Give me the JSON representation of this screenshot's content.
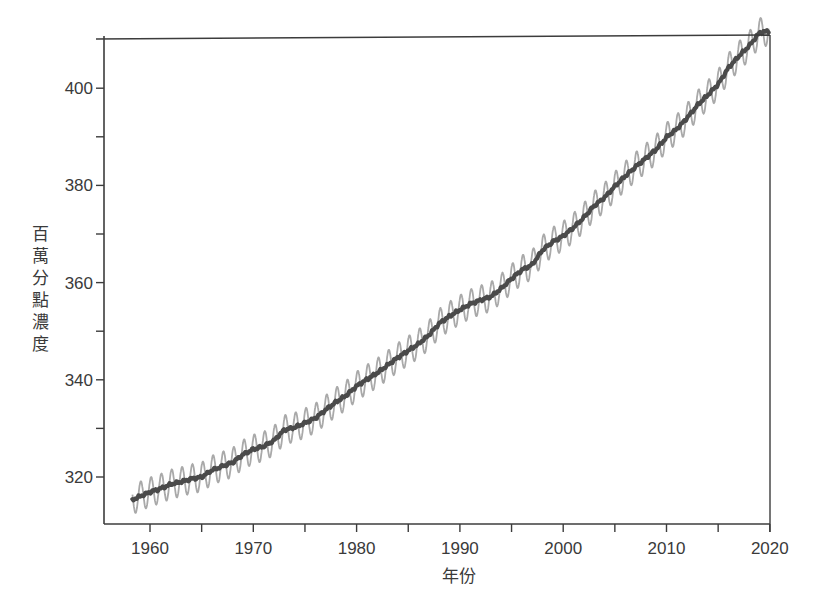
{
  "chart_data": {
    "type": "line",
    "title": "",
    "xlabel": "年份",
    "ylabel": "百萬分點濃度",
    "xlim": [
      1955.5,
      2020
    ],
    "ylim": [
      311,
      411
    ],
    "grid": false,
    "legend": null,
    "x_ticks": {
      "major": [
        1960,
        1970,
        1980,
        1990,
        2000,
        2010,
        2020
      ],
      "major_labels": [
        "1960",
        "1970",
        "1980",
        "1990",
        "2000",
        "2010",
        "2020"
      ],
      "minor": [
        1965,
        1975,
        1985,
        1995,
        2005,
        2015
      ]
    },
    "y_ticks": {
      "major": [
        320,
        340,
        360,
        380,
        400
      ],
      "major_labels": [
        "320",
        "340",
        "360",
        "380",
        "400"
      ],
      "minor": [
        330,
        350,
        370,
        390
      ]
    },
    "series": [
      {
        "name": "annual_trend",
        "style": "thick dark line",
        "color": "#4a4a4a",
        "x": [
          1958.3,
          1959,
          1960,
          1961,
          1962,
          1963,
          1964,
          1965,
          1966,
          1967,
          1968,
          1969,
          1970,
          1971,
          1972,
          1973,
          1974,
          1975,
          1976,
          1977,
          1978,
          1979,
          1980,
          1981,
          1982,
          1983,
          1984,
          1985,
          1986,
          1987,
          1988,
          1989,
          1990,
          1991,
          1992,
          1993,
          1994,
          1995,
          1996,
          1997,
          1998,
          1999,
          2000,
          2001,
          2002,
          2003,
          2004,
          2005,
          2006,
          2007,
          2008,
          2009,
          2010,
          2011,
          2012,
          2013,
          2014,
          2015,
          2016,
          2017,
          2018,
          2019,
          2019.9
        ],
        "values": [
          315.3,
          316.0,
          316.9,
          317.6,
          318.5,
          319.0,
          319.6,
          320.0,
          321.4,
          322.2,
          323.0,
          324.6,
          325.7,
          326.3,
          327.5,
          329.7,
          330.2,
          331.1,
          332.1,
          333.8,
          335.4,
          336.8,
          338.7,
          340.1,
          341.4,
          343.0,
          344.6,
          346.0,
          347.4,
          349.2,
          351.6,
          353.1,
          354.4,
          355.6,
          356.4,
          357.1,
          358.8,
          360.8,
          362.6,
          363.7,
          366.7,
          368.4,
          369.6,
          371.3,
          373.4,
          375.8,
          377.5,
          379.8,
          381.9,
          383.8,
          385.6,
          387.4,
          389.9,
          391.6,
          393.9,
          396.5,
          398.6,
          400.8,
          404.2,
          406.6,
          408.7,
          411.4,
          411.8
        ]
      },
      {
        "name": "monthly_seasonal",
        "style": "thin light gray oscillating line",
        "color": "#a9a9a9",
        "seasonal_amplitude_ppm": 3.0,
        "description": "Monthly values oscillating around annual trend, ~1 cycle per year"
      }
    ]
  },
  "axes": {
    "x_label": "年份",
    "y_label_chars": [
      "百",
      "萬",
      "分",
      "點",
      "濃",
      "度"
    ],
    "x_tick_labels": [
      "1960",
      "1970",
      "1980",
      "1990",
      "2000",
      "2010",
      "2020"
    ],
    "y_tick_labels": [
      "320",
      "340",
      "360",
      "380",
      "400"
    ]
  },
  "colors": {
    "axis": "#3c3c3c",
    "trend": "#4a4a4a",
    "seasonal": "#a9a9a9",
    "text": "#3a3a3a"
  }
}
